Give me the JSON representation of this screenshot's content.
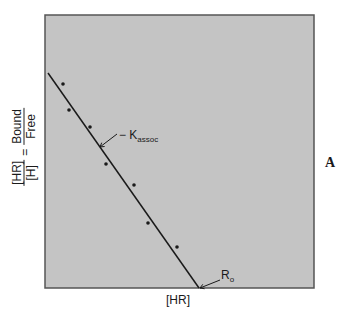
{
  "chart_data": {
    "type": "scatter",
    "title": "",
    "panel_label": "A",
    "xlabel": "[HR]",
    "ylabel": {
      "left_num": "[HR]",
      "left_den": "[H]",
      "equals": "=",
      "right_num": "Bound",
      "right_den": "Free"
    },
    "grid": false,
    "axis_ticks": false,
    "plot_area_px": {
      "left": 45,
      "top": 15,
      "right": 314,
      "bottom": 288
    },
    "background_color": "#c4c4c4",
    "series": [
      {
        "name": "data points",
        "type": "scatter",
        "points_px": [
          [
            63,
            84
          ],
          [
            69,
            110
          ],
          [
            90,
            127
          ],
          [
            106,
            164
          ],
          [
            134,
            185
          ],
          [
            148,
            223
          ],
          [
            177,
            247
          ]
        ]
      },
      {
        "name": "fit line",
        "type": "line",
        "points_px": [
          [
            48,
            73
          ],
          [
            199,
            288
          ]
        ]
      }
    ],
    "annotations": [
      {
        "text": "− K",
        "sub": "assoc",
        "meaning": "slope = -Kassoc",
        "arrow_from_px": [
          117,
          134
        ],
        "arrow_to_px": [
          100,
          147
        ]
      },
      {
        "text": "R",
        "sub": "o",
        "meaning": "x-intercept = R0",
        "arrow_from_px": [
          220,
          280
        ],
        "arrow_to_px": [
          200,
          288
        ]
      }
    ]
  },
  "labels": {
    "x_axis": "[HR]",
    "y_left_num": "[HR]",
    "y_left_den": "[H]",
    "y_equals": "=",
    "y_right_num": "Bound",
    "y_right_den": "Free",
    "kassoc_main": "− K",
    "kassoc_sub": "assoc",
    "ro_main": "R",
    "ro_sub": "o",
    "panel": "A"
  }
}
